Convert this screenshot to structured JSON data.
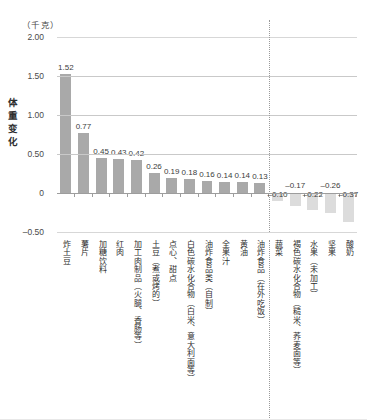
{
  "chart_data": {
    "type": "bar",
    "title": "",
    "subtitle": "",
    "unit_caption": "（千克）",
    "ylabel": "体重变化",
    "xlabel": "",
    "ylim": [
      -0.5,
      2.0
    ],
    "yticks": [
      "2.00",
      "1.50",
      "1.00",
      "0.50",
      "0",
      "-0.50"
    ],
    "ytick_values": [
      2.0,
      1.5,
      1.0,
      0.5,
      0,
      -0.5
    ],
    "grid": "horizontal",
    "legend": "none",
    "divider_note": "dotted vertical line separating weight-gain foods from weight-loss foods",
    "categories": [
      "炸土豆",
      "薯片",
      "加糖饮料",
      "红肉",
      "加工肉制品（火腿、香肠等）",
      "土豆（煮或烤的）",
      "点心、甜点",
      "白色碳水化合物（白米、意大利面等）",
      "油炸食品类（自制）",
      "全果汁",
      "黄油",
      "油炸食品（在外吃饭）",
      "蔬菜",
      "褐色碳水化合物（糙米、荞麦面等）",
      "水果（未加工）",
      "坚果",
      "酸奶"
    ],
    "values": [
      1.52,
      0.77,
      0.45,
      0.43,
      0.42,
      0.26,
      0.19,
      0.18,
      0.16,
      0.14,
      0.14,
      0.13,
      -0.1,
      -0.17,
      -0.22,
      -0.26,
      -0.37
    ],
    "value_labels": [
      "1.52",
      "0.77",
      "0.45",
      "0.43",
      "0.42",
      "0.26",
      "0.19",
      "0.18",
      "0.16",
      "0.14",
      "0.14",
      "0.13",
      "-0.10",
      "-0.17",
      "-0.22",
      "-0.26",
      "-0.37"
    ],
    "colors": {
      "positive_bar": "#a9a9a9",
      "negative_bar": "#dcdcdc",
      "gridline": "#c9c9c9",
      "axis": "#9d9d9d",
      "text": "#3a3a3a",
      "background": "#ffffff"
    }
  }
}
